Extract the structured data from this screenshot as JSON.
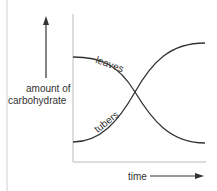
{
  "diagram": {
    "y_label_line1": "amount of",
    "y_label_line2": "carbohydrate",
    "x_label": "time",
    "curves": [
      {
        "name": "leaves",
        "label": "leaves",
        "trend": "decreasing"
      },
      {
        "name": "tubers",
        "label": "tubers",
        "trend": "increasing"
      }
    ],
    "colors": {
      "line": "#333333",
      "border": "#cccccc"
    }
  }
}
